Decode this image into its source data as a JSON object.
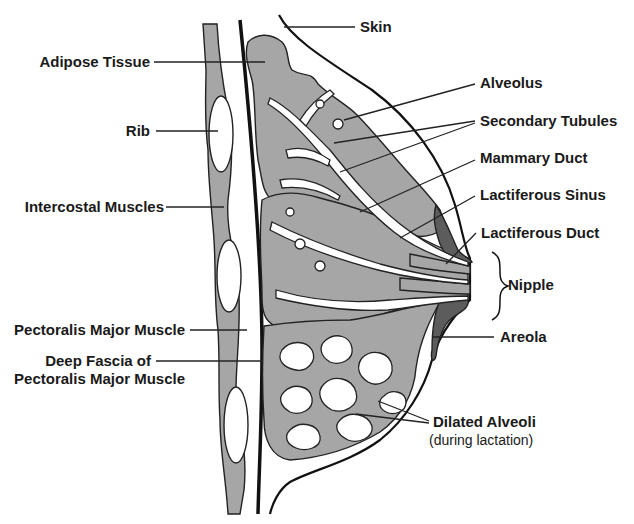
{
  "figure": {
    "colors": {
      "background": "#ffffff",
      "glandular_tissue": "#a6a6a6",
      "areola_dark": "#5c5c5c",
      "outline": "#222222",
      "ducts_and_alveoli": "#ffffff"
    }
  },
  "labels": {
    "left": [
      {
        "id": "adipose",
        "text": "Adipose Tissue"
      },
      {
        "id": "rib",
        "text": "Rib"
      },
      {
        "id": "intercostal",
        "text": "Intercostal Muscles"
      },
      {
        "id": "pectoralis",
        "text": "Pectoralis Major Muscle"
      },
      {
        "id": "fascia_line1",
        "text": "Deep Fascia of"
      },
      {
        "id": "fascia_line2",
        "text": "Pectoralis Major Muscle"
      }
    ],
    "right": [
      {
        "id": "skin",
        "text": "Skin"
      },
      {
        "id": "alveolus",
        "text": "Alveolus"
      },
      {
        "id": "secondary",
        "text": "Secondary Tubules"
      },
      {
        "id": "mammary",
        "text": "Mammary Duct"
      },
      {
        "id": "sinus",
        "text": "Lactiferous Sinus"
      },
      {
        "id": "lduct",
        "text": "Lactiferous Duct"
      },
      {
        "id": "nipple",
        "text": "Nipple"
      },
      {
        "id": "areola",
        "text": "Areola"
      },
      {
        "id": "dilated",
        "text": "Dilated Alveoli"
      },
      {
        "id": "dilated_note",
        "text": "(during lactation)"
      }
    ]
  }
}
